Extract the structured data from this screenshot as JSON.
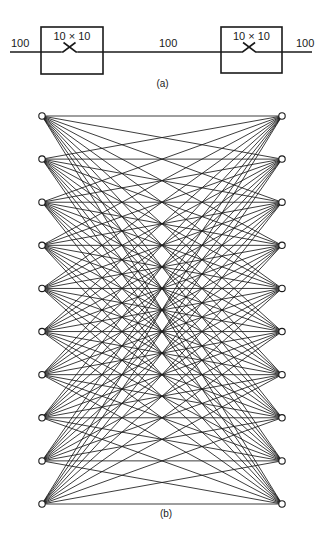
{
  "header_cutoff_text": "",
  "diagram_a": {
    "caption": "(a)",
    "input_label": "100",
    "link_label": "100",
    "output_label": "100",
    "switches": [
      {
        "label": "10 × 10",
        "x": 41,
        "y": 27,
        "w": 62,
        "h": 47
      },
      {
        "label": "10 × 10",
        "x": 221,
        "y": 27,
        "w": 61,
        "h": 46
      }
    ],
    "line_y": 52,
    "line_x_start": 10,
    "line_x_end": 312
  },
  "diagram_b": {
    "caption": "(b)",
    "description": "Complete bipartite connection: 10 left nodes each connected to all 10 right nodes",
    "left_nodes": 10,
    "right_nodes": 10,
    "left_x": 42,
    "right_x": 282,
    "top_y": 116,
    "bottom_y": 504,
    "node_radius": 3.2
  },
  "colors": {
    "stroke": "#1a1a1a",
    "background": "#ffffff"
  }
}
